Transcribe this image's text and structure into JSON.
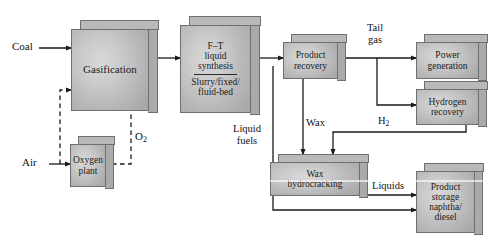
{
  "diagram": {
    "colors": {
      "block_face": "#cbcbcb",
      "block_shade": "#b4b4b4",
      "block_outline": "#6f6f6f",
      "line": "#1a1a1a",
      "background": "#ffffff"
    },
    "blocks": [
      {
        "id": "gasification",
        "label": "Gasification",
        "lines": [
          "Gasification"
        ]
      },
      {
        "id": "ft-synthesis",
        "label": "F–T liquid synthesis / Slurry/fixed/fluid-bed",
        "lines": [
          "F–T",
          "liquid",
          "synthesis"
        ],
        "sub_lines": [
          "Slurry/fixed/",
          "fluid-bed"
        ],
        "has_divider": true
      },
      {
        "id": "oxygen-plant",
        "label": "Oxygen plant",
        "lines": [
          "Oxygen",
          "plant"
        ]
      },
      {
        "id": "product-recovery",
        "label": "Product recovery",
        "lines": [
          "Product",
          "recovery"
        ]
      },
      {
        "id": "power-generation",
        "label": "Power generation",
        "lines": [
          "Power",
          "generation"
        ]
      },
      {
        "id": "hydrogen-recovery",
        "label": "Hydrogen recovery",
        "lines": [
          "Hydrogen",
          "recovery"
        ]
      },
      {
        "id": "wax-hydrocracking",
        "label": "Wax hydrocracking",
        "lines": [
          "Wax",
          "hydrocracking"
        ]
      },
      {
        "id": "product-storage",
        "label": "Product storage naphtha/diesel",
        "lines": [
          "Product",
          "storage",
          "naphtha/",
          "diesel"
        ]
      }
    ],
    "stream_labels": [
      {
        "id": "coal",
        "text": "Coal"
      },
      {
        "id": "air",
        "text": "Air"
      },
      {
        "id": "oxygen",
        "text": "O",
        "sub": "2"
      },
      {
        "id": "tail-gas",
        "line1": "Tail",
        "line2": "gas"
      },
      {
        "id": "hydrogen",
        "text": "H",
        "sub": "2"
      },
      {
        "id": "wax",
        "text": "Wax"
      },
      {
        "id": "liquid-fuels",
        "line1": "Liquid",
        "line2": "fuels"
      },
      {
        "id": "liquids",
        "text": "Liquids"
      }
    ]
  }
}
